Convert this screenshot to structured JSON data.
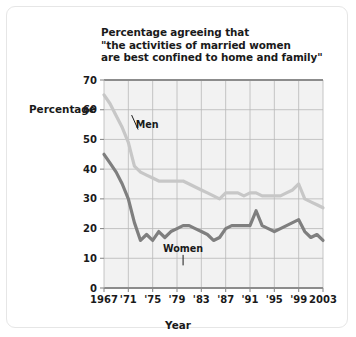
{
  "figure": {
    "border_color": "#e6e6e6",
    "background": "#ffffff"
  },
  "title": {
    "text": "Percentage agreeing that\n\"the activities of married women\nare best confined to home and family\"",
    "line1": "Percentage agreeing that",
    "line2": "\"the activities of married women",
    "line3": "are best confined to home and family\""
  },
  "axes": {
    "y_title": "Percentage",
    "x_title": "Year"
  },
  "chart_data": {
    "type": "line",
    "title": "Percentage agreeing that \"the activities of married women are best confined to home and family\"",
    "xlabel": "Year",
    "ylabel": "Percentage",
    "xlim": [
      1967,
      2003
    ],
    "ylim": [
      0,
      70
    ],
    "grid": true,
    "legend": "inline-annotations",
    "y_ticks": [
      0,
      10,
      20,
      30,
      40,
      50,
      60,
      70
    ],
    "y_tick_labels": [
      "0",
      "10",
      "20",
      "30",
      "40",
      "50",
      "60",
      "70"
    ],
    "x_ticks": [
      1967,
      1971,
      1975,
      1979,
      1983,
      1987,
      1991,
      1995,
      1999,
      2003
    ],
    "x_tick_labels": [
      "1967",
      "'71",
      "'75",
      "'79",
      "'83",
      "'87",
      "'91",
      "'95",
      "'99",
      "2003"
    ],
    "x": [
      1967,
      1968,
      1969,
      1970,
      1971,
      1972,
      1973,
      1974,
      1975,
      1976,
      1977,
      1978,
      1979,
      1980,
      1981,
      1982,
      1983,
      1984,
      1985,
      1986,
      1987,
      1988,
      1989,
      1990,
      1991,
      1992,
      1993,
      1994,
      1995,
      1996,
      1997,
      1998,
      1999,
      2000,
      2001,
      2002,
      2003
    ],
    "series": [
      {
        "name": "Men",
        "color": "#c7c7c7",
        "label_x": 1972.2,
        "label_y": 55,
        "values": [
          65,
          62,
          58,
          54,
          49,
          41,
          39,
          38,
          37,
          36,
          36,
          36,
          36,
          36,
          35,
          34,
          33,
          32,
          31,
          30,
          32,
          32,
          32,
          31,
          32,
          32,
          31,
          31,
          31,
          31,
          32,
          33,
          35,
          30,
          29,
          28,
          27
        ]
      },
      {
        "name": "Women",
        "color": "#7f7f7f",
        "label_x": 1980.0,
        "label_y": 13,
        "values": [
          45,
          42,
          39,
          35,
          30,
          22,
          16,
          18,
          16,
          19,
          17,
          19,
          20,
          21,
          21,
          20,
          19,
          18,
          16,
          17,
          20,
          21,
          21,
          21,
          21,
          26,
          21,
          20,
          19,
          20,
          21,
          22,
          23,
          19,
          17,
          18,
          16
        ]
      }
    ]
  }
}
